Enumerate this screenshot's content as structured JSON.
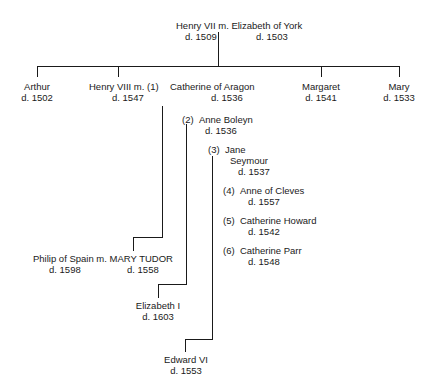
{
  "root": {
    "husband": "Henry VII",
    "wife": "Elizabeth of York",
    "married_marker": "m.",
    "husband_death": "d. 1509",
    "wife_death": "d. 1503",
    "line": "Henry VII m. Elizabeth of York"
  },
  "children": [
    {
      "name": "Arthur",
      "death": "d. 1502"
    },
    {
      "name": "Henry VIII m. (1)",
      "death": "d. 1547"
    },
    {
      "name": "Catherine of Aragon",
      "death": "d. 1536"
    },
    {
      "name": "Margaret",
      "death": "d. 1541"
    },
    {
      "name": "Mary",
      "death": "d. 1533"
    }
  ],
  "wives": [
    {
      "num": "(2)",
      "name": "Anne Boleyn",
      "death": "d. 1536"
    },
    {
      "num": "(3)",
      "name": "Jane",
      "name2": "Seymour",
      "death": "d. 1537"
    },
    {
      "num": "(4)",
      "name": "Anne of Cleves",
      "death": "d. 1557"
    },
    {
      "num": "(5)",
      "name": "Catherine Howard",
      "death": "d. 1542"
    },
    {
      "num": "(6)",
      "name": "Catherine Parr",
      "death": "d. 1548"
    }
  ],
  "grandchildren": [
    {
      "name": "Philip of Spain m. MARY TUDOR",
      "death_left": "d. 1598",
      "death_right": "d. 1558"
    },
    {
      "name": "Elizabeth I",
      "death": "d. 1603"
    },
    {
      "name": "Edward VI",
      "death": "d. 1553"
    }
  ]
}
